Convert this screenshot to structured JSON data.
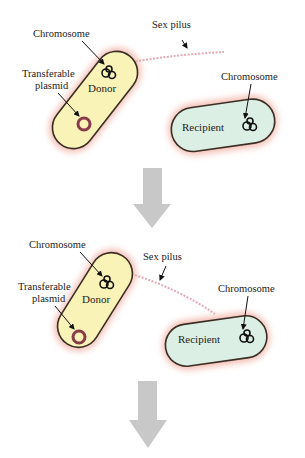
{
  "diagram": {
    "type": "bacterial conjugation",
    "colors": {
      "donor_fill": "#f9f3b8",
      "recipient_fill": "#dcefe4",
      "cell_outline": "#3a2e24",
      "cell_halo": "#f0a89a",
      "plasmid": "#8a3a4a",
      "pilus": "#e6a8b6",
      "arrow": "#c8c8c8"
    },
    "panels": [
      {
        "donor_label": "Donor",
        "recipient_label": "Recipient",
        "chromosome_label_donor": "Chromosome",
        "chromosome_label_recipient": "Chromosome",
        "plasmid_label_line1": "Transferable",
        "plasmid_label_line2": "plasmid",
        "pilus_label": "Sex pilus"
      },
      {
        "donor_label": "Donor",
        "recipient_label": "Recipient",
        "chromosome_label_donor": "Chromosome",
        "chromosome_label_recipient": "Chromosome",
        "plasmid_label_line1": "Transferable",
        "plasmid_label_line2": "plasmid",
        "pilus_label": "Sex pilus"
      }
    ]
  }
}
